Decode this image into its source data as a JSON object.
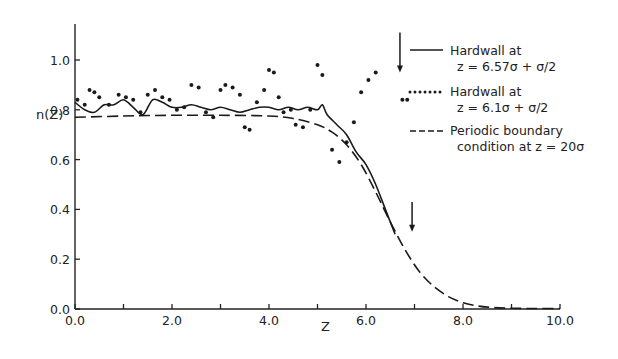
{
  "chart_data": {
    "type": "line",
    "title": "",
    "xlabel": "Z",
    "ylabel": "n(Z)",
    "xlim": [
      0.0,
      10.0
    ],
    "ylim": [
      0.0,
      1.15
    ],
    "x_ticks": [
      "0.0",
      "2.0",
      "4.0",
      "6.0",
      "8.0",
      "10.0"
    ],
    "x_minor_ticks": [
      1.0,
      3.0,
      5.0,
      7.0,
      9.0
    ],
    "y_ticks": [
      "0.0",
      "0.2",
      "0.4",
      "0.6",
      "0.8",
      "1.0"
    ],
    "grid": false,
    "legend_position": "upper right",
    "series": [
      {
        "name": "Hardwall at z = 6.57σ + σ/2",
        "legend_line1": "Hardwall at",
        "legend_line2": "z = 6.57σ + σ/2",
        "style": "solid",
        "x": [
          0.0,
          0.2,
          0.4,
          0.6,
          0.8,
          1.0,
          1.2,
          1.4,
          1.6,
          1.8,
          2.0,
          2.2,
          2.4,
          2.6,
          2.8,
          3.0,
          3.2,
          3.4,
          3.6,
          3.8,
          4.0,
          4.2,
          4.4,
          4.6,
          4.8,
          5.0,
          5.1,
          5.2,
          5.4,
          5.6,
          5.8,
          6.0,
          6.2,
          6.4,
          6.6
        ],
        "y": [
          0.83,
          0.8,
          0.79,
          0.82,
          0.82,
          0.84,
          0.81,
          0.78,
          0.84,
          0.83,
          0.81,
          0.81,
          0.82,
          0.81,
          0.8,
          0.81,
          0.8,
          0.79,
          0.8,
          0.81,
          0.81,
          0.8,
          0.81,
          0.8,
          0.81,
          0.8,
          0.82,
          0.78,
          0.74,
          0.7,
          0.63,
          0.58,
          0.5,
          0.4,
          0.3
        ]
      },
      {
        "name": "Hardwall at z = 6.1σ + σ/2",
        "legend_line1": "Hardwall at",
        "legend_line2": "z = 6.1σ + σ/2",
        "style": "dotted",
        "x": [
          0.05,
          0.2,
          0.3,
          0.4,
          0.5,
          0.7,
          0.9,
          1.05,
          1.2,
          1.35,
          1.5,
          1.65,
          1.8,
          1.95,
          2.1,
          2.25,
          2.4,
          2.55,
          2.7,
          2.85,
          3.0,
          3.1,
          3.25,
          3.4,
          3.5,
          3.6,
          3.75,
          3.9,
          4.0,
          4.1,
          4.2,
          4.3,
          4.45,
          4.55,
          4.7,
          4.85,
          5.0,
          5.1,
          5.3,
          5.45,
          5.6,
          5.75,
          5.9,
          6.05,
          6.2,
          6.75,
          6.85
        ],
        "y": [
          0.84,
          0.82,
          0.88,
          0.87,
          0.85,
          0.82,
          0.86,
          0.85,
          0.84,
          0.79,
          0.86,
          0.88,
          0.85,
          0.84,
          0.8,
          0.81,
          0.9,
          0.89,
          0.79,
          0.77,
          0.88,
          0.9,
          0.89,
          0.86,
          0.73,
          0.72,
          0.83,
          0.88,
          0.96,
          0.95,
          0.85,
          0.79,
          0.8,
          0.74,
          0.73,
          0.8,
          0.98,
          0.94,
          0.64,
          0.59,
          0.67,
          0.75,
          0.87,
          0.92,
          0.95,
          0.84,
          0.84
        ]
      },
      {
        "name": "Periodic boundary condition at z = 20σ",
        "legend_line1": "Periodic boundary",
        "legend_line2": "condition at z = 20σ",
        "style": "dashed",
        "x": [
          0.0,
          1.0,
          2.0,
          3.0,
          4.0,
          4.5,
          5.0,
          5.3,
          5.6,
          5.9,
          6.2,
          6.5,
          6.8,
          7.1,
          7.4,
          7.7,
          8.0,
          8.3,
          8.6,
          9.0,
          9.5,
          10.0
        ],
        "y": [
          0.77,
          0.775,
          0.778,
          0.778,
          0.775,
          0.765,
          0.74,
          0.71,
          0.66,
          0.58,
          0.47,
          0.35,
          0.24,
          0.15,
          0.09,
          0.05,
          0.025,
          0.012,
          0.006,
          0.003,
          0.002,
          0.002
        ]
      }
    ],
    "annotations": [
      {
        "type": "arrow-down",
        "x": 6.7,
        "y_from": 1.11,
        "y_to": 0.95,
        "note": "upper arrow near legend"
      },
      {
        "type": "arrow-down",
        "x": 6.95,
        "y_from": 0.43,
        "y_to": 0.31,
        "note": "lower arrow near curve"
      }
    ]
  },
  "axes": {
    "x_label": "Z",
    "y_label": "n(Z)"
  },
  "legend": {
    "items": [
      {
        "line1": "Hardwall at",
        "line2": "z = 6.57σ + σ/2",
        "style": "solid"
      },
      {
        "line1": "Hardwall at",
        "line2": "z = 6.1σ + σ/2",
        "style": "dotted"
      },
      {
        "line1": "Periodic boundary",
        "line2": "condition at z = 20σ",
        "style": "dashed"
      }
    ]
  }
}
